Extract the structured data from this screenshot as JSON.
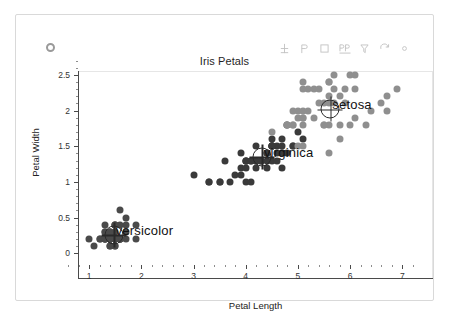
{
  "window": {
    "dot_icon": "circle-icon",
    "toolbar": [
      {
        "name": "axes-move-icon",
        "glyph": "move"
      },
      {
        "name": "pan-icon",
        "glyph": "pan"
      },
      {
        "name": "rectangle-select-icon",
        "glyph": "rect"
      },
      {
        "name": "text-annotate-icon",
        "glyph": "text"
      },
      {
        "name": "filter-icon",
        "glyph": "filter"
      },
      {
        "name": "refresh-icon",
        "glyph": "refresh"
      },
      {
        "name": "more-options-icon",
        "glyph": "dot"
      }
    ]
  },
  "chart_data": {
    "type": "scatter",
    "title": "Iris Petals",
    "xlabel": "Petal Length",
    "ylabel": "Petal Width",
    "xlim": [
      0.5,
      7.3
    ],
    "ylim": [
      -0.15,
      2.75
    ],
    "xticks": [
      1,
      2,
      3,
      4,
      5,
      6,
      7
    ],
    "xticklabels": [
      "1",
      "2",
      "3",
      "4",
      "5",
      "6",
      "7"
    ],
    "yticks": [
      0,
      0.5,
      1,
      1.5,
      2,
      2.5
    ],
    "yticklabels": [
      "0",
      "0.5",
      "1",
      "1.5",
      "2",
      "2.5"
    ],
    "grid": false,
    "legend_position": "none",
    "annotations": [
      {
        "text": "setosa",
        "x": 5.62,
        "y": 2.02,
        "marker": "crosshair-marker"
      },
      {
        "text": "virginica",
        "x": 4.31,
        "y": 1.35,
        "marker": "crosshair-marker"
      },
      {
        "text": "versicolor",
        "x": 1.47,
        "y": 0.26,
        "marker": "crosshair-marker"
      }
    ],
    "series": [
      {
        "name": "versicolor",
        "color": "#4a4a4a",
        "points": [
          [
            1.4,
            0.2
          ],
          [
            1.4,
            0.2
          ],
          [
            1.3,
            0.2
          ],
          [
            1.5,
            0.2
          ],
          [
            1.4,
            0.2
          ],
          [
            1.7,
            0.4
          ],
          [
            1.4,
            0.3
          ],
          [
            1.5,
            0.2
          ],
          [
            1.4,
            0.2
          ],
          [
            1.5,
            0.1
          ],
          [
            1.5,
            0.2
          ],
          [
            1.6,
            0.2
          ],
          [
            1.4,
            0.1
          ],
          [
            1.1,
            0.1
          ],
          [
            1.2,
            0.2
          ],
          [
            1.5,
            0.4
          ],
          [
            1.3,
            0.4
          ],
          [
            1.4,
            0.3
          ],
          [
            1.7,
            0.3
          ],
          [
            1.5,
            0.3
          ],
          [
            1.7,
            0.2
          ],
          [
            1.5,
            0.4
          ],
          [
            1.0,
            0.2
          ],
          [
            1.7,
            0.5
          ],
          [
            1.9,
            0.2
          ],
          [
            1.6,
            0.2
          ],
          [
            1.6,
            0.4
          ],
          [
            1.5,
            0.2
          ],
          [
            1.4,
            0.2
          ],
          [
            1.6,
            0.2
          ],
          [
            1.6,
            0.2
          ],
          [
            1.5,
            0.4
          ],
          [
            1.5,
            0.1
          ],
          [
            1.4,
            0.2
          ],
          [
            1.5,
            0.2
          ],
          [
            1.2,
            0.2
          ],
          [
            1.3,
            0.2
          ],
          [
            1.4,
            0.1
          ],
          [
            1.3,
            0.2
          ],
          [
            1.5,
            0.2
          ],
          [
            1.3,
            0.3
          ],
          [
            1.3,
            0.3
          ],
          [
            1.3,
            0.2
          ],
          [
            1.6,
            0.6
          ],
          [
            1.9,
            0.4
          ],
          [
            1.4,
            0.3
          ],
          [
            1.6,
            0.2
          ],
          [
            1.4,
            0.2
          ],
          [
            1.5,
            0.2
          ],
          [
            1.4,
            0.2
          ]
        ]
      },
      {
        "name": "virginica",
        "color": "#3a3a3a",
        "points": [
          [
            4.7,
            1.4
          ],
          [
            4.5,
            1.5
          ],
          [
            4.9,
            1.5
          ],
          [
            4.0,
            1.3
          ],
          [
            4.6,
            1.5
          ],
          [
            4.5,
            1.3
          ],
          [
            4.7,
            1.6
          ],
          [
            3.3,
            1.0
          ],
          [
            4.6,
            1.3
          ],
          [
            3.9,
            1.4
          ],
          [
            3.5,
            1.0
          ],
          [
            4.2,
            1.5
          ],
          [
            4.0,
            1.0
          ],
          [
            4.7,
            1.4
          ],
          [
            3.6,
            1.3
          ],
          [
            4.4,
            1.4
          ],
          [
            4.5,
            1.5
          ],
          [
            4.1,
            1.0
          ],
          [
            4.5,
            1.5
          ],
          [
            3.9,
            1.1
          ],
          [
            4.8,
            1.8
          ],
          [
            4.0,
            1.3
          ],
          [
            4.9,
            1.5
          ],
          [
            4.7,
            1.2
          ],
          [
            4.3,
            1.3
          ],
          [
            4.4,
            1.4
          ],
          [
            4.8,
            1.4
          ],
          [
            5.0,
            1.7
          ],
          [
            4.5,
            1.5
          ],
          [
            3.5,
            1.0
          ],
          [
            3.8,
            1.1
          ],
          [
            3.7,
            1.0
          ],
          [
            3.9,
            1.2
          ],
          [
            5.1,
            1.6
          ],
          [
            4.5,
            1.5
          ],
          [
            4.5,
            1.6
          ],
          [
            4.7,
            1.5
          ],
          [
            4.4,
            1.3
          ],
          [
            4.1,
            1.3
          ],
          [
            4.0,
            1.3
          ],
          [
            4.4,
            1.2
          ],
          [
            4.6,
            1.4
          ],
          [
            4.0,
            1.2
          ],
          [
            3.3,
            1.0
          ],
          [
            4.2,
            1.3
          ],
          [
            4.2,
            1.2
          ],
          [
            4.2,
            1.3
          ],
          [
            4.3,
            1.3
          ],
          [
            3.0,
            1.1
          ],
          [
            4.1,
            1.3
          ]
        ]
      },
      {
        "name": "setosa",
        "color": "#8f8f8f",
        "points": [
          [
            6.0,
            2.5
          ],
          [
            5.1,
            1.9
          ],
          [
            5.9,
            2.1
          ],
          [
            5.6,
            1.8
          ],
          [
            5.8,
            2.2
          ],
          [
            6.6,
            2.1
          ],
          [
            4.5,
            1.7
          ],
          [
            6.3,
            1.8
          ],
          [
            5.8,
            1.8
          ],
          [
            6.1,
            2.5
          ],
          [
            5.1,
            2.0
          ],
          [
            5.3,
            1.9
          ],
          [
            5.5,
            2.1
          ],
          [
            5.0,
            2.0
          ],
          [
            5.1,
            2.4
          ],
          [
            5.3,
            2.3
          ],
          [
            5.5,
            1.8
          ],
          [
            6.7,
            2.2
          ],
          [
            6.9,
            2.3
          ],
          [
            5.0,
            1.5
          ],
          [
            5.7,
            2.3
          ],
          [
            4.9,
            2.0
          ],
          [
            6.7,
            2.0
          ],
          [
            4.9,
            1.8
          ],
          [
            5.7,
            2.1
          ],
          [
            6.0,
            1.8
          ],
          [
            4.8,
            1.8
          ],
          [
            4.9,
            1.8
          ],
          [
            5.6,
            2.1
          ],
          [
            5.8,
            1.6
          ],
          [
            6.1,
            1.9
          ],
          [
            6.4,
            2.0
          ],
          [
            5.6,
            2.2
          ],
          [
            5.1,
            1.5
          ],
          [
            5.6,
            1.4
          ],
          [
            6.1,
            2.3
          ],
          [
            5.6,
            2.4
          ],
          [
            5.5,
            1.8
          ],
          [
            4.8,
            1.8
          ],
          [
            5.4,
            2.1
          ],
          [
            5.6,
            2.4
          ],
          [
            5.1,
            2.3
          ],
          [
            5.1,
            1.9
          ],
          [
            5.9,
            2.3
          ],
          [
            5.7,
            2.5
          ],
          [
            5.2,
            2.3
          ],
          [
            5.0,
            1.9
          ],
          [
            5.2,
            2.0
          ],
          [
            5.4,
            2.3
          ],
          [
            5.1,
            1.8
          ]
        ]
      }
    ]
  }
}
